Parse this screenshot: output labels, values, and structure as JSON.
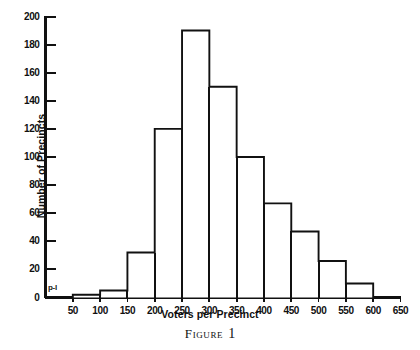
{
  "figure": {
    "caption_word": "Figure",
    "caption_number": "1",
    "origin_annotation": "p-l"
  },
  "chart_data": {
    "type": "bar",
    "title": "",
    "xlabel": "Voters per Precinct",
    "ylabel": "Number of Precincts",
    "xlim": [
      0,
      650
    ],
    "ylim": [
      0,
      200
    ],
    "grid": false,
    "legend": false,
    "bin_width": 50,
    "bin_edges": [
      0,
      50,
      100,
      150,
      200,
      250,
      300,
      350,
      400,
      450,
      500,
      550,
      600,
      650
    ],
    "categories": [
      "0-50",
      "50-100",
      "100-150",
      "150-200",
      "200-250",
      "250-300",
      "300-350",
      "350-400",
      "400-450",
      "450-500",
      "500-550",
      "550-600",
      "600-650"
    ],
    "values": [
      0,
      2,
      5,
      32,
      120,
      190,
      150,
      100,
      67,
      47,
      26,
      10,
      0
    ],
    "xticks": [
      50,
      100,
      150,
      200,
      250,
      300,
      350,
      400,
      450,
      500,
      550,
      600,
      650
    ],
    "xtick_labels": [
      "50",
      "100",
      "150",
      "200",
      "250",
      "300",
      "350",
      "400",
      "450",
      "500",
      "550",
      "600",
      "650"
    ],
    "yticks": [
      0,
      20,
      40,
      60,
      80,
      100,
      120,
      140,
      160,
      180,
      200
    ],
    "ytick_labels": [
      "0",
      "20",
      "40",
      "60",
      "80",
      "100",
      "120",
      "140",
      "160",
      "180",
      "200"
    ],
    "line_color": "#111111",
    "fill_color": "#ffffff"
  }
}
